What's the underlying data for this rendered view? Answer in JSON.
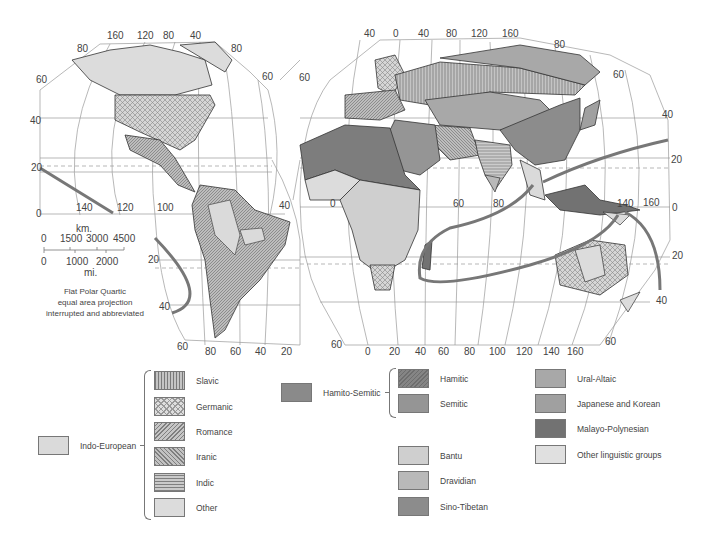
{
  "map": {
    "projection_note": [
      "Flat Polar Quartic",
      "equal area projection",
      "interrupted and abbreviated"
    ],
    "scale": {
      "km_label": "km.",
      "km_ticks": [
        "0",
        "1500",
        "3000",
        "4500"
      ],
      "mi_ticks": [
        "0",
        "1000",
        "2000"
      ],
      "mi_label": "mi."
    },
    "americas_lon_top": [
      "160",
      "120",
      "80",
      "40"
    ],
    "americas_lat_left": [
      "80",
      "60",
      "40",
      "20",
      "0"
    ],
    "americas_lat_right": [
      "80",
      "60"
    ],
    "americas_lon_equator": [
      "140",
      "120",
      "100"
    ],
    "south_america_lat": [
      "20",
      "40",
      "60"
    ],
    "south_america_lon_bottom": [
      "80",
      "60",
      "40",
      "20"
    ],
    "south_america_40": "40",
    "eurasia_lon_top": [
      "40",
      "0",
      "40",
      "80",
      "120",
      "160"
    ],
    "eurasia_lat_left": "60",
    "eurasia_lat_right": [
      "80",
      "60",
      "40",
      "20",
      "0",
      "20",
      "40",
      "60"
    ],
    "eurasia_lon_equator": [
      "0",
      "60",
      "80",
      "140",
      "160"
    ],
    "eurasia_lon_bottom": [
      "0",
      "20",
      "40",
      "60",
      "80",
      "100",
      "120",
      "140",
      "160"
    ],
    "eurasia_bottom_60_left": "60",
    "eurasia_bottom_60_right": "60"
  },
  "legend": {
    "indo_european": {
      "label": "Indo-European",
      "color": "#dadada",
      "subgroups": [
        {
          "label": "Slavic",
          "pattern": "vertical-lines"
        },
        {
          "label": "Germanic",
          "pattern": "crosshatch"
        },
        {
          "label": "Romance",
          "pattern": "diagonal-fine"
        },
        {
          "label": "Iranic",
          "pattern": "diagonal-back"
        },
        {
          "label": "Indic",
          "pattern": "horizontal-lines"
        },
        {
          "label": "Other",
          "pattern": "plain-light"
        }
      ]
    },
    "hamito_semitic": {
      "label": "Hamito-Semitic",
      "color": "#8a8a8a",
      "subgroups": [
        {
          "label": "Hamitic",
          "color": "#7d7d7d"
        },
        {
          "label": "Semitic",
          "color": "#959595"
        }
      ]
    },
    "others_mid": [
      {
        "label": "Bantu",
        "color": "#cfcfcf"
      },
      {
        "label": "Dravidian",
        "color": "#b9b9b9"
      },
      {
        "label": "Sino-Tibetan",
        "color": "#8c8c8c"
      }
    ],
    "others_right": [
      {
        "label": "Ural-Altaic",
        "color": "#a8a8a8"
      },
      {
        "label": "Japanese and Korean",
        "color": "#a0a0a0"
      },
      {
        "label": "Malayo-Polynesian",
        "color": "#727272"
      },
      {
        "label": "Other linguistic groups",
        "color": "#e0e0e0"
      }
    ]
  }
}
